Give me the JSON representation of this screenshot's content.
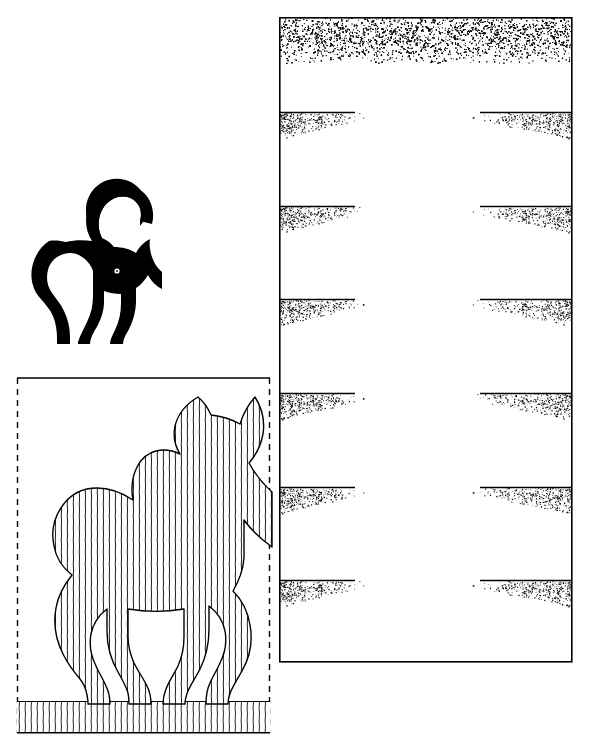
{
  "page": {
    "width": 592,
    "height": 752,
    "background_color": "#ffffff",
    "ink_color": "#000000"
  },
  "figures": {
    "silhouette_cat": {
      "name": "black cat silhouette",
      "description": "Solid black cat standing with arched back, tail curled up over the body, head facing right, one small white eye",
      "fill_color": "#000000",
      "eye_color": "#ffffff",
      "bounds": {
        "x": 18,
        "y": 222,
        "width": 125,
        "height": 122
      },
      "facing": "right"
    },
    "hatched_cat": {
      "name": "vertically hatched cat line drawing",
      "description": "Outline cat in same pose as silhouette but mirrored, filled with close vertical hatching, standing on a hatched ground strip inside a dashed crop box",
      "stroke_color": "#000000",
      "hatch_stroke_width": 0.9,
      "hatch_spacing_px": 6,
      "facing": "right",
      "bounds": {
        "x": 17,
        "y": 380,
        "width": 253,
        "height": 353
      }
    },
    "crop_box": {
      "name": "dashed crop rectangle",
      "x": 17,
      "y": 378,
      "width": 253,
      "height": 355,
      "border_style": "dashed",
      "dash_pattern": "6 5",
      "stroke_width": 1.4,
      "top_edge_style": "solid"
    },
    "ground_strip": {
      "name": "hatched ground strip",
      "x": 17,
      "y": 701,
      "width": 253,
      "height": 32,
      "hatch_spacing_px": 6
    }
  },
  "stipple_panel": {
    "name": "stippled column panel",
    "x": 279,
    "y": 17,
    "width": 293,
    "height": 645,
    "border_stroke_width": 1.6,
    "border_color": "#000000",
    "top_band": {
      "name": "top stipple band",
      "y": 17,
      "height": 46,
      "density": "dense-fading-down"
    },
    "divider_label": "horizontal rule with fading stipple",
    "dividers": [
      {
        "y": 112,
        "left_rule_width": 76,
        "right_rule_width": 92
      },
      {
        "y": 206,
        "left_rule_width": 76,
        "right_rule_width": 92
      },
      {
        "y": 299,
        "left_rule_width": 76,
        "right_rule_width": 92
      },
      {
        "y": 393,
        "left_rule_width": 76,
        "right_rule_width": 92
      },
      {
        "y": 487,
        "left_rule_width": 76,
        "right_rule_width": 92
      },
      {
        "y": 580,
        "left_rule_width": 76,
        "right_rule_width": 92
      }
    ],
    "stipple_dot_color": "#000000",
    "stipple_fade_direction_left": "down-right",
    "stipple_fade_direction_right": "down-left"
  }
}
